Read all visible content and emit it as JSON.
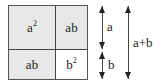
{
  "diagram": {
    "title": "",
    "square": {
      "cells": [
        {
          "id": "a2",
          "base": "a",
          "exp": "2",
          "fill": "#e8e8e8"
        },
        {
          "id": "ab_top",
          "label": "ab",
          "fill": "#e8e8e8"
        },
        {
          "id": "ab_bottom",
          "label": "ab",
          "fill": "#e8e8e8"
        },
        {
          "id": "b2",
          "base": "b",
          "exp": "2",
          "fill": "#ffffff"
        }
      ]
    },
    "dimensions": [
      {
        "id": "a",
        "label": "a"
      },
      {
        "id": "b",
        "label": "b"
      },
      {
        "id": "a_plus_b",
        "label": "a+b"
      }
    ]
  }
}
